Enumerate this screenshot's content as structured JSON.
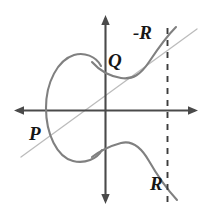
{
  "figure": {
    "background_color": "#ffffff",
    "width": 209,
    "height": 217
  },
  "labels": {
    "p": "P",
    "q": "Q",
    "neg_r": "-R",
    "r": "R"
  },
  "colors": {
    "curve": "#808080",
    "axis": "#4a4a4a",
    "secant_line": "#bcbcbc",
    "dashed_line": "#3c3c3c",
    "label_text": "#161616"
  },
  "axes": {
    "x_axis": {
      "y": 110,
      "x_start": 15,
      "x_end": 197,
      "arrows": "both"
    },
    "y_axis": {
      "x": 105,
      "y_start": 16,
      "y_end": 203,
      "arrows": "both"
    }
  },
  "elements": {
    "dashed_vertical": {
      "x": 167,
      "y_start": 28,
      "y_end": 206
    },
    "secant_line": {
      "x1": 21,
      "y1": 157,
      "x2": 197,
      "y2": 29
    },
    "oval_component": {
      "cx": 74,
      "cy": 108,
      "rx": 28,
      "ry": 53
    },
    "right_branch": "continuous branch passing through Q and -R above axis and R below axis"
  }
}
